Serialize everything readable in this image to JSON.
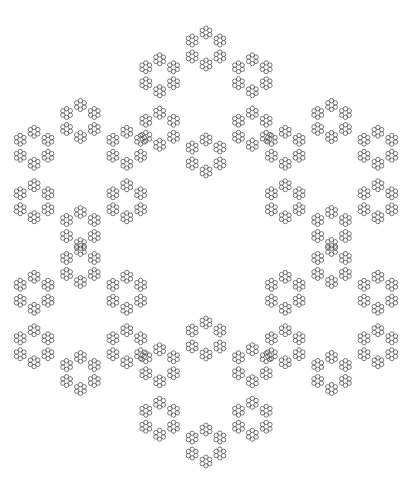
{
  "figure": {
    "kind": "hexagonal circle fractal (hexaflake-style ring of rings)",
    "width": 411,
    "height": 492,
    "background": "#ffffff",
    "stroke_color": "#555555",
    "stroke_width": 0.8,
    "center": [
      206,
      247
    ],
    "levels": 4,
    "branching": 6,
    "start_angle_deg": 90,
    "ring_radii": [
      145,
      53.5,
      16,
      4.3
    ],
    "circle_radius": 2.2
  }
}
